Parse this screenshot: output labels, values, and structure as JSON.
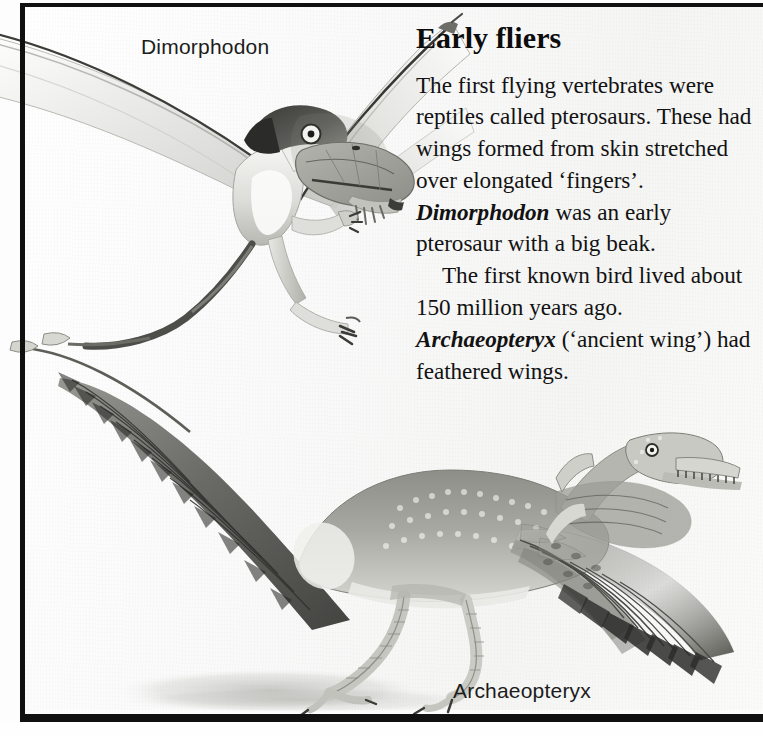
{
  "page": {
    "width": 763,
    "height": 736,
    "background_color": "#fdfdfd",
    "frame_color": "#101010",
    "ink_color": "#121212"
  },
  "article": {
    "headline": "Early fliers",
    "paragraphs": [
      {
        "id": "paragraph-pterosaurs",
        "runs": [
          {
            "text": "The first flying vertebrates were reptiles called pterosaurs. These had wings formed from skin stretched over elongated ‘fingers’. ",
            "style": "roman"
          },
          {
            "text": "Dimorphodon",
            "style": "italic"
          },
          {
            "text": " was an early pterosaur with a big beak.",
            "style": "roman"
          }
        ]
      },
      {
        "id": "paragraph-archaeopteryx",
        "runs": [
          {
            "text": "The first known bird lived about 150 million years ago. ",
            "style": "roman"
          },
          {
            "text": "Archaeopteryx",
            "style": "italic"
          },
          {
            "text": " (‘ancient wing’) had feathered wings.",
            "style": "roman"
          }
        ]
      }
    ]
  },
  "figures": [
    {
      "id": "figure-dimorphodon",
      "caption": "Dimorphodon",
      "subject": "pterosaur in flight, membrane wings, large beaked head, long thin tail",
      "medium": "pencil illustration, greyscale"
    },
    {
      "id": "figure-archaeopteryx",
      "caption": "Archaeopteryx",
      "subject": "feathered bird-like dinosaur running, long feathered tail, clawed wings, toothed jaw",
      "medium": "pencil illustration, greyscale"
    }
  ],
  "captions": {
    "dimorphodon": "Dimorphodon",
    "archaeopteryx": "Archaeopteryx"
  }
}
